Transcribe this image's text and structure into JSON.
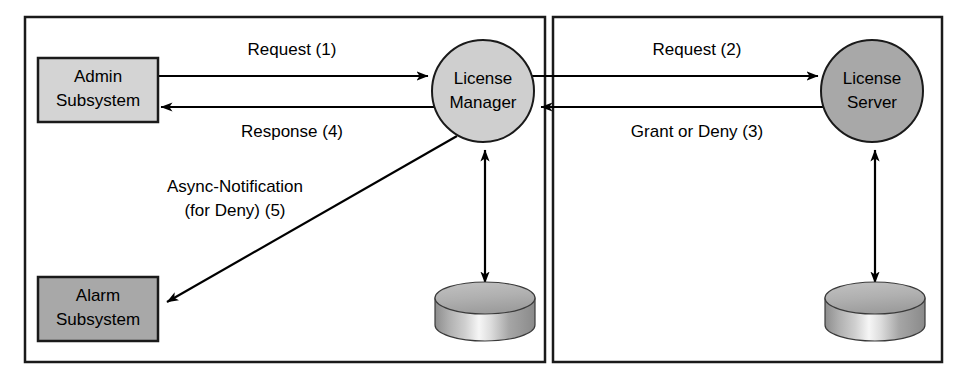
{
  "diagram": {
    "colors": {
      "background": "#ffffff",
      "stroke": "#1a1a1a",
      "admin_box_fill": "#d4d4d4",
      "alarm_box_fill": "#a8a8a8",
      "license_manager_fill": "#cfcfcf",
      "license_server_fill": "#a8a8a8",
      "cylinder_top": "#b5b5b5",
      "cylinder_body_light": "#f2f2f2",
      "cylinder_body_dark": "#8f8f8f"
    },
    "frames": [
      {
        "id": "left-frame",
        "name": "left-system-boundary"
      },
      {
        "id": "right-frame",
        "name": "right-system-boundary"
      }
    ],
    "nodes": {
      "admin_subsystem": {
        "line1": "Admin",
        "line2": "Subsystem"
      },
      "alarm_subsystem": {
        "line1": "Alarm",
        "line2": "Subsystem"
      },
      "license_manager": {
        "line1": "License",
        "line2": "Manager"
      },
      "license_server": {
        "line1": "License",
        "line2": "Server"
      },
      "license_manager_db": {
        "label": ""
      },
      "license_server_db": {
        "label": ""
      }
    },
    "edges": [
      {
        "id": "request-1",
        "label": "Request (1)",
        "from": "Admin Subsystem",
        "to": "License Manager"
      },
      {
        "id": "response-4",
        "label": "Response (4)",
        "from": "License Manager",
        "to": "Admin Subsystem"
      },
      {
        "id": "request-2",
        "label": "Request (2)",
        "from": "License Manager",
        "to": "License Server"
      },
      {
        "id": "grant-or-deny-3",
        "label": "Grant or Deny (3)",
        "from": "License Server",
        "to": "License Manager"
      },
      {
        "id": "async-notification-5",
        "label_line1": "Async-Notification",
        "label_line2": "(for Deny) (5)",
        "from": "License Manager",
        "to": "Alarm Subsystem"
      },
      {
        "id": "lm-db-link",
        "label": "",
        "from": "License Manager",
        "to": "License Manager Database"
      },
      {
        "id": "ls-db-link",
        "label": "",
        "from": "License Server",
        "to": "License Server Database"
      }
    ]
  }
}
